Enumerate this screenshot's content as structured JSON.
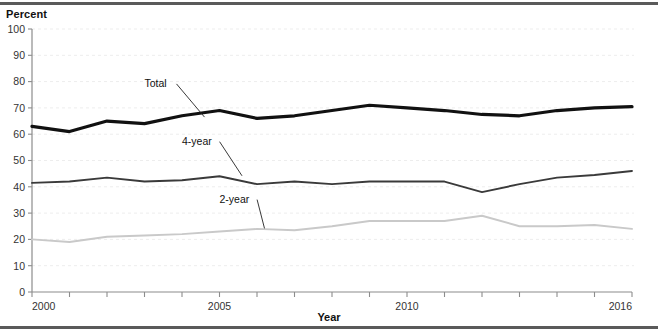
{
  "figure": {
    "y_axis_title": "Percent",
    "x_axis_title": "Year"
  },
  "labels": {
    "total": "Total",
    "four_year": "4-year",
    "two_year": "2-year"
  },
  "ticks": {
    "y": [
      "0",
      "10",
      "20",
      "30",
      "40",
      "50",
      "60",
      "70",
      "80",
      "90",
      "100"
    ],
    "x": [
      "2000",
      "2005",
      "2010",
      "2016"
    ]
  },
  "colors": {
    "total": "#111111",
    "four_year": "#3a3a3a",
    "two_year": "#c9c9c9",
    "grid": "#ededed",
    "axis": "#8c8c8c",
    "rule": "#5a5a5a"
  },
  "chart_data": {
    "type": "line",
    "title": "",
    "subtitle": "",
    "xlabel": "Year",
    "ylabel": "Percent",
    "xlim": [
      2000,
      2016
    ],
    "ylim": [
      0,
      100
    ],
    "grid": true,
    "legend": "inline-annotations",
    "x": [
      2000,
      2001,
      2002,
      2003,
      2004,
      2005,
      2006,
      2007,
      2008,
      2009,
      2010,
      2011,
      2012,
      2013,
      2014,
      2015,
      2016
    ],
    "xtick_values": [
      2000,
      2005,
      2010,
      2016
    ],
    "ytick_values": [
      0,
      10,
      20,
      30,
      40,
      50,
      60,
      70,
      80,
      90,
      100
    ],
    "series": [
      {
        "name": "Total",
        "color": "#111111",
        "width": 3.2,
        "values": [
          63,
          61,
          65,
          64,
          67,
          69,
          66,
          67,
          69,
          71,
          70,
          69,
          67.5,
          67,
          69,
          70,
          70.5
        ],
        "annotation": {
          "text": "Total",
          "x": 2003,
          "y": 78
        }
      },
      {
        "name": "4-year",
        "color": "#3a3a3a",
        "width": 1.9,
        "values": [
          41.5,
          42,
          43.5,
          42,
          42.5,
          44,
          41,
          42,
          41,
          42,
          42,
          42,
          38,
          41,
          43.5,
          44.5,
          46
        ],
        "annotation": {
          "text": "4-year",
          "x": 2004,
          "y": 56
        }
      },
      {
        "name": "2-year",
        "color": "#c9c9c9",
        "width": 1.9,
        "values": [
          20,
          19,
          21,
          21.5,
          22,
          23,
          24,
          23.5,
          25,
          27,
          27,
          27,
          29,
          25,
          25,
          25.5,
          24
        ],
        "annotation": {
          "text": "2-year",
          "x": 2005,
          "y": 34
        }
      }
    ]
  }
}
